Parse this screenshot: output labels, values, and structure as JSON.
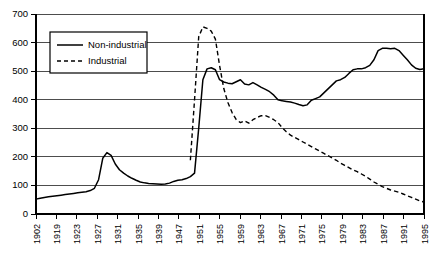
{
  "chart_data": {
    "type": "line",
    "title": "",
    "subtitle": "",
    "xlabel": "",
    "ylabel": "",
    "ylim": [
      0,
      700
    ],
    "y_ticks": [
      0,
      100,
      200,
      300,
      400,
      500,
      600,
      700
    ],
    "grid": "horizontal",
    "legend_position": "top-left",
    "x_tick_labels": [
      "1902",
      "1919",
      "1923",
      "1927",
      "1931",
      "1935",
      "1939",
      "1947",
      "1951",
      "1955",
      "1959",
      "1963",
      "1967",
      "1971",
      "1975",
      "1979",
      "1983",
      "1987",
      "1991",
      "1995"
    ],
    "x_start": 1902,
    "x_end": 1995,
    "series": [
      {
        "name": "Non-industrial",
        "style": "solid",
        "color": "#000000",
        "x": [
          1902,
          1903,
          1904,
          1905,
          1906,
          1907,
          1908,
          1909,
          1910,
          1911,
          1912,
          1913,
          1914,
          1915,
          1916,
          1917,
          1918,
          1919,
          1920,
          1921,
          1922,
          1923,
          1924,
          1925,
          1926,
          1927,
          1928,
          1929,
          1930,
          1931,
          1932,
          1933,
          1934,
          1935,
          1936,
          1937,
          1938,
          1939,
          1940,
          1941,
          1942,
          1943,
          1944,
          1945,
          1946,
          1947,
          1948,
          1949,
          1950,
          1951,
          1952,
          1953,
          1954,
          1955,
          1956,
          1957,
          1958,
          1959,
          1960,
          1961,
          1962,
          1963,
          1964,
          1965,
          1966,
          1967,
          1968,
          1969,
          1970,
          1971,
          1972,
          1973,
          1974,
          1975,
          1976,
          1977,
          1978,
          1979,
          1980,
          1981,
          1982,
          1983,
          1984,
          1985,
          1986,
          1987,
          1988,
          1989,
          1990,
          1991,
          1992,
          1993,
          1994,
          1995
        ],
        "values": [
          52,
          55,
          58,
          60,
          62,
          64,
          66,
          68,
          70,
          72,
          74,
          76,
          78,
          82,
          90,
          120,
          195,
          215,
          205,
          175,
          155,
          143,
          133,
          125,
          118,
          112,
          109,
          107,
          106,
          105,
          104,
          105,
          108,
          114,
          118,
          120,
          124,
          131,
          143,
          300,
          470,
          508,
          512,
          505,
          470,
          462,
          458,
          456,
          463,
          470,
          455,
          452,
          460,
          452,
          443,
          436,
          428,
          416,
          400,
          396,
          394,
          392,
          388,
          383,
          379,
          382,
          398,
          404,
          410,
          424,
          438,
          452,
          466,
          470,
          478,
          492,
          505,
          508,
          508,
          512,
          520,
          540,
          572,
          580,
          580,
          578,
          580,
          572,
          556,
          540,
          522,
          510,
          506,
          508
        ],
        "note": "Continues 1990-1995 near 505-510 with slight dip at end to 492"
      },
      {
        "name": "Industrial",
        "style": "dashed",
        "color": "#000000",
        "x": [
          1939,
          1940,
          1941,
          1942,
          1943,
          1944,
          1945,
          1946,
          1947,
          1948,
          1949,
          1950,
          1951,
          1952,
          1953,
          1954,
          1955,
          1956,
          1957,
          1958,
          1959,
          1960,
          1961,
          1962,
          1963,
          1964,
          1965,
          1966,
          1967,
          1968,
          1969,
          1970,
          1971,
          1972,
          1973,
          1974,
          1975,
          1976,
          1977,
          1978,
          1979,
          1980,
          1981,
          1982,
          1983,
          1984,
          1985,
          1986,
          1987,
          1988,
          1989,
          1990,
          1991,
          1992,
          1993,
          1994,
          1995
        ],
        "values": [
          188,
          400,
          620,
          655,
          650,
          640,
          612,
          520,
          440,
          390,
          355,
          330,
          320,
          326,
          318,
          330,
          338,
          344,
          344,
          338,
          330,
          320,
          302,
          288,
          276,
          268,
          260,
          252,
          244,
          236,
          228,
          220,
          212,
          204,
          196,
          188,
          178,
          170,
          162,
          154,
          148,
          140,
          132,
          122,
          112,
          104,
          96,
          90,
          84,
          80,
          76,
          70,
          64,
          58,
          52,
          46,
          42
        ],
        "note": "Series begins at 1939 rising sharply to peak 655 around 1943, then long decline to 42 at 1995"
      }
    ],
    "legend": [
      {
        "label": "Non-industrial",
        "style": "solid"
      },
      {
        "label": "Industrial",
        "style": "dashed"
      }
    ]
  }
}
